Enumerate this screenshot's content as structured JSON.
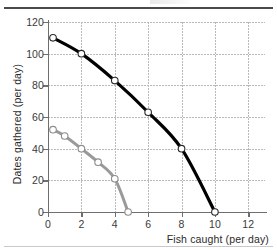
{
  "figure": {
    "caption_top": "",
    "caption_bottom": ""
  },
  "chart_data": {
    "type": "line",
    "title": "",
    "xlabel": "Fish caught (per day)",
    "ylabel": "Dates gathered (per day)",
    "xlim": [
      0,
      13
    ],
    "ylim": [
      0,
      120
    ],
    "xticks": [
      0,
      2,
      4,
      6,
      8,
      10,
      12
    ],
    "xtick_labels": [
      "0",
      "2",
      "4",
      "6",
      "8",
      "10",
      "12"
    ],
    "yticks": [
      0,
      20,
      40,
      60,
      80,
      100,
      120
    ],
    "ytick_labels": [
      "0",
      "20",
      "40",
      "60",
      "80",
      "100",
      "120"
    ],
    "grid": true,
    "grid_style": "dotted",
    "legend": false,
    "marker": "open-circle",
    "series": [
      {
        "name": "outer-frontier",
        "color": "#000000",
        "linewidth": 3.2,
        "points": [
          {
            "x": 0.3,
            "y": 110
          },
          {
            "x": 2.0,
            "y": 100
          },
          {
            "x": 4.0,
            "y": 83
          },
          {
            "x": 6.0,
            "y": 63
          },
          {
            "x": 8.0,
            "y": 40
          },
          {
            "x": 10.0,
            "y": 0
          }
        ]
      },
      {
        "name": "inner-frontier",
        "color": "#9a9a9a",
        "linewidth": 3.0,
        "points": [
          {
            "x": 0.3,
            "y": 52
          },
          {
            "x": 1.0,
            "y": 48
          },
          {
            "x": 2.0,
            "y": 40
          },
          {
            "x": 3.0,
            "y": 31.5
          },
          {
            "x": 4.0,
            "y": 21
          },
          {
            "x": 4.8,
            "y": 0
          }
        ]
      }
    ]
  }
}
